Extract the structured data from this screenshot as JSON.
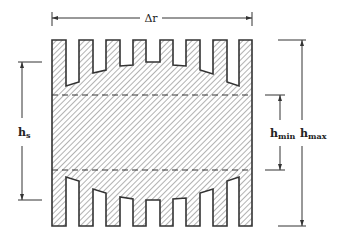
{
  "figure": {
    "type": "technical cross-section drawing",
    "colors": {
      "stroke": "#333333",
      "hatch": "#555555",
      "background": "#ffffff"
    }
  },
  "dimensions": {
    "width_label": "Δr",
    "left_label": {
      "main": "h",
      "sub": "s"
    },
    "inner_right_label": {
      "main": "h",
      "sub": "min"
    },
    "outer_right_label": {
      "main": "h",
      "sub": "max"
    }
  },
  "geometry": {
    "top_slots_count": 7,
    "bottom_slots_count": 7,
    "dashed_lines": 2
  }
}
